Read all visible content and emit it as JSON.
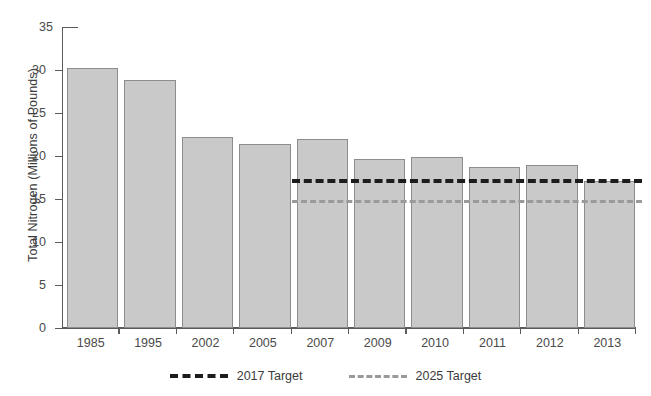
{
  "chart_data": {
    "type": "bar",
    "title": "",
    "xlabel": "",
    "ylabel": "Total Nitrogen (Millions of Pounds)",
    "ylim": [
      0,
      35
    ],
    "ytick_values": [
      0,
      5,
      10,
      15,
      20,
      25,
      30,
      35
    ],
    "ytick_labels": [
      "0",
      "5",
      "10",
      "15",
      "20",
      "25",
      "30",
      "35"
    ],
    "grid": false,
    "legend_position": "bottom-center",
    "categories": [
      "1985",
      "1995",
      "2002",
      "2005",
      "2007",
      "2009",
      "2010",
      "2011",
      "2012",
      "2013"
    ],
    "series": [
      {
        "name": "Total Nitrogen",
        "type": "bar",
        "color": "#c9c9c9",
        "edge_color": "#8d8d8d",
        "values": [
          30.2,
          28.8,
          22.2,
          21.4,
          22.0,
          19.7,
          19.9,
          18.7,
          19.0,
          17.1
        ]
      }
    ],
    "reference_lines": [
      {
        "name": "2017 Target",
        "value": 17.3,
        "color": "#1c1c1c",
        "style": "dashed",
        "starts_at_category": "2007"
      },
      {
        "name": "2025 Target",
        "value": 14.9,
        "color": "#9a9a9a",
        "style": "dashed",
        "starts_at_category": "2007"
      }
    ],
    "legend": [
      {
        "label": "2017 Target",
        "color": "#1c1c1c",
        "style": "dashed"
      },
      {
        "label": "2025 Target",
        "color": "#9a9a9a",
        "style": "dashed"
      }
    ]
  }
}
